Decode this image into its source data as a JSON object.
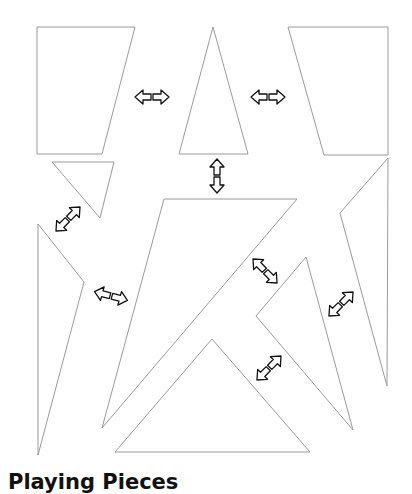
{
  "caption": "Playing Pieces",
  "colors": {
    "outline": "#9a9a9a",
    "arrow_stroke": "#111111",
    "background": "#ffffff"
  },
  "pieces": [
    {
      "name": "piece-left-trapezoid",
      "points": "37,27 135,27 102,154 37,154"
    },
    {
      "name": "piece-center-tall-triangle",
      "points": "213,27 248,154 179,154"
    },
    {
      "name": "piece-right-trapezoid",
      "points": "288,27 388,27 388,155 324,155"
    },
    {
      "name": "piece-small-left-triangle",
      "points": "52,162 114,162 100,218"
    },
    {
      "name": "piece-left-long-sliver",
      "points": "38,224 84,282 38,455"
    },
    {
      "name": "piece-large-triangle",
      "points": "164,199 297,199 102,428"
    },
    {
      "name": "piece-right-sliver",
      "points": "388,158 340,213 387,386"
    },
    {
      "name": "piece-right-middle-triangle",
      "points": "306,257 256,316 353,430"
    },
    {
      "name": "piece-bottom-triangle",
      "points": "212,339 310,452 115,452"
    }
  ],
  "arrows": [
    {
      "name": "move-handle-1",
      "x": 152,
      "y": 97,
      "angle": 0
    },
    {
      "name": "move-handle-2",
      "x": 268,
      "y": 97,
      "angle": 0
    },
    {
      "name": "move-handle-3",
      "x": 217,
      "y": 176,
      "angle": 90
    },
    {
      "name": "move-handle-4",
      "x": 68,
      "y": 219,
      "angle": -45
    },
    {
      "name": "move-handle-5",
      "x": 111,
      "y": 296,
      "angle": 15
    },
    {
      "name": "move-handle-6",
      "x": 265,
      "y": 271,
      "angle": 45
    },
    {
      "name": "move-handle-7",
      "x": 341,
      "y": 304,
      "angle": -45
    },
    {
      "name": "move-handle-8",
      "x": 269,
      "y": 368,
      "angle": -45
    }
  ]
}
